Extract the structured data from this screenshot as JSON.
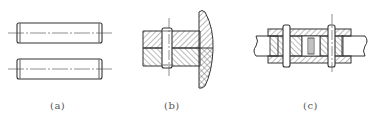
{
  "figure": {
    "background": "#ffffff",
    "stroke_color": "#333333",
    "hatch_color": "#555555",
    "panels": [
      {
        "id": "a",
        "caption": "(a)",
        "description": "Two cylindrical pins (side view) with centerlines"
      },
      {
        "id": "b",
        "caption": "(b)",
        "description": "Pin joining two plates with a flanged part, sectional view with hatching"
      },
      {
        "id": "c",
        "caption": "(c)",
        "description": "Sleeve coupling joining two shafts with two transverse pins, sectional view"
      }
    ]
  }
}
